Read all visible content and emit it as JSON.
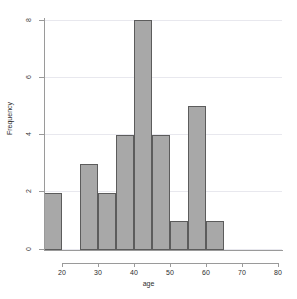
{
  "chart_data": {
    "type": "bar",
    "title": "",
    "subtitle": "",
    "xlabel": "age",
    "ylabel": "Frequency",
    "xlim": [
      20,
      80
    ],
    "ylim": [
      0,
      8
    ],
    "grid": true,
    "legend": null,
    "bin_width": 5,
    "categories": [
      "20-25",
      "25-30",
      "30-35",
      "35-40",
      "40-45",
      "45-50",
      "50-55",
      "55-60",
      "60-65",
      "65-70"
    ],
    "bin_edges": [
      20,
      25,
      30,
      35,
      40,
      45,
      50,
      55,
      60,
      65,
      70
    ],
    "values": [
      2,
      0,
      3,
      2,
      4,
      8,
      4,
      1,
      5,
      1
    ],
    "bars": [
      {
        "x0": 20,
        "x1": 25,
        "value": 2
      },
      {
        "x0": 25,
        "x1": 30,
        "value": 0
      },
      {
        "x0": 30,
        "x1": 35,
        "value": 3
      },
      {
        "x0": 35,
        "x1": 40,
        "value": 2
      },
      {
        "x0": 40,
        "x1": 45,
        "value": 4
      },
      {
        "x0": 45,
        "x1": 50,
        "value": 8
      },
      {
        "x0": 50,
        "x1": 55,
        "value": 4
      },
      {
        "x0": 55,
        "x1": 60,
        "value": 1
      },
      {
        "x0": 60,
        "x1": 65,
        "value": 5
      },
      {
        "x0": 65,
        "x1": 70,
        "value": 1
      }
    ],
    "xticks": [
      20,
      30,
      40,
      50,
      60,
      70,
      80
    ],
    "xtick_labels": [
      "20",
      "30",
      "40",
      "50",
      "60",
      "70",
      "80"
    ],
    "yticks": [
      0,
      2,
      4,
      6,
      8
    ],
    "ytick_labels": [
      "0",
      "2",
      "4",
      "6",
      "8"
    ],
    "colors": {
      "bar_fill": "#a8a8a8",
      "bar_edge": "#5c5c5c",
      "grid": "#e8e8ee",
      "axis": "#9a9a9a",
      "text": "#2e2e2e",
      "background": "#ffffff"
    }
  },
  "axes": {
    "y_title": "Frequency",
    "x_title": "age"
  }
}
